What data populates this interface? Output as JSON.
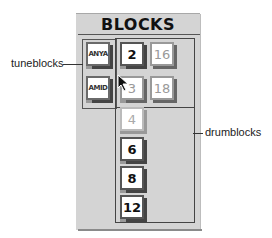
{
  "panel": {
    "title": "BLOCKS"
  },
  "tuneblocks": [
    {
      "label": "ANYA"
    },
    {
      "label": "AMID"
    }
  ],
  "drumblocks": [
    {
      "label": "2",
      "style": "dark"
    },
    {
      "label": "16",
      "style": "light"
    },
    {
      "label": "3",
      "style": "light"
    },
    {
      "label": "18",
      "style": "light"
    },
    {
      "label": "4",
      "style": "faint"
    },
    {
      "label": "6",
      "style": "dark"
    },
    {
      "label": "8",
      "style": "dark"
    },
    {
      "label": "12",
      "style": "dark"
    }
  ],
  "callouts": {
    "left": "tuneblocks",
    "right": "drumblocks"
  }
}
